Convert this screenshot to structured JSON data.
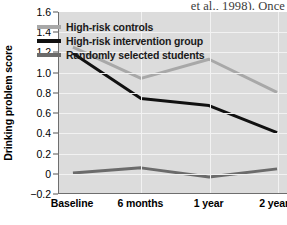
{
  "page_fragment": {
    "text": "et al., 1998). Once"
  },
  "chart_data": {
    "type": "line",
    "title": "",
    "xlabel": "",
    "ylabel": "Drinking problem score",
    "categories": [
      "Baseline",
      "6 months",
      "1 year",
      "2 years"
    ],
    "ylim": [
      -0.2,
      1.6
    ],
    "ytick_labels": [
      "1.6",
      "1.4",
      "1.2",
      "1.0",
      "0.8",
      "0.6",
      "0.4",
      "0.2",
      "0",
      "-0.2"
    ],
    "ytick_values": [
      1.6,
      1.4,
      1.2,
      1.0,
      0.8,
      0.6,
      0.4,
      0.2,
      0,
      -0.2
    ],
    "grid": true,
    "legend_position": "top-center",
    "plot_background": "#dcdcdc",
    "gridline_color": "#f2f2f2",
    "series": [
      {
        "name": "High-risk controls",
        "color": "#a8a8a8",
        "values": [
          1.25,
          0.94,
          1.13,
          0.8
        ]
      },
      {
        "name": "High-risk intervention group",
        "color": "#111111",
        "values": [
          1.19,
          0.74,
          0.67,
          0.4
        ]
      },
      {
        "name": "Randomly selected students",
        "color": "#6b6b6b",
        "values": [
          0.0,
          0.05,
          -0.04,
          0.04
        ]
      }
    ]
  }
}
